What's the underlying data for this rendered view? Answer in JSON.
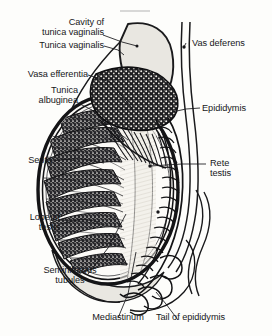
{
  "figure": {
    "kind": "anatomical-line-drawing",
    "style": "black-and-white engraved halftone scan",
    "width": 272,
    "height": 336,
    "background_color": "#fdfdfb",
    "ink_color": "#17171a",
    "cavity_fill_color": "#e9e7e1",
    "rete_fill_color": "#f2f0ea",
    "lobule_fill_color": "#2a2a2c"
  },
  "labels": {
    "cavity_of_tunica_vaginalis": "Cavity of\ntunica vaginalis",
    "tunica_vaginalis": "Tunica vaginalis",
    "vasa_efferentia": "Vasa efferentia",
    "tunica_albuginea": "Tunica\nalbuginea",
    "septa": "Septa",
    "lobe_of_testis": "Lobe of\ntestis",
    "seminiferous_tubules": "Seminiferous\ntubules",
    "mediastinum": "Mediastinum",
    "vas_deferens": "Vas deferens",
    "epididymis": "Epididymis",
    "rete_testis": "Rete\ntestis",
    "tail_of_epididymis": "Tail of epididymis"
  }
}
